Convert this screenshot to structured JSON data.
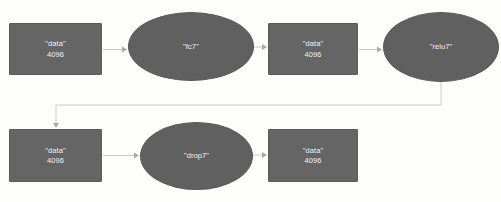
{
  "diagram": {
    "type": "neural-network-graph",
    "background_color": "#fdfdfc",
    "blob_fill": "#656565",
    "layer_fill": "#606060",
    "edge_color": "#c9c9c9",
    "text_color": "#f2f2f2",
    "nodes": [
      {
        "id": "data-1",
        "shape": "rectangle",
        "role": "blob",
        "name": "\"data\"",
        "dim": "4096",
        "x": 9,
        "y": 23,
        "w": 93,
        "h": 52
      },
      {
        "id": "fc7",
        "shape": "ellipse",
        "role": "layer",
        "name": "\"fc7\"",
        "dim": "",
        "x": 128,
        "y": 12,
        "w": 126,
        "h": 69
      },
      {
        "id": "data-2",
        "shape": "rectangle",
        "role": "blob",
        "name": "\"data\"",
        "dim": "4096",
        "x": 268,
        "y": 23,
        "w": 90,
        "h": 52
      },
      {
        "id": "relu7",
        "shape": "ellipse",
        "role": "layer",
        "name": "\"relu7\"",
        "dim": "",
        "x": 383,
        "y": 12,
        "w": 116,
        "h": 70
      },
      {
        "id": "data-3",
        "shape": "rectangle",
        "role": "blob",
        "name": "\"data\"",
        "dim": "4096",
        "x": 9,
        "y": 129,
        "w": 93,
        "h": 53
      },
      {
        "id": "drop7",
        "shape": "ellipse",
        "role": "layer",
        "name": "\"drop7\"",
        "dim": "",
        "x": 140,
        "y": 122,
        "w": 113,
        "h": 68
      },
      {
        "id": "data-4",
        "shape": "rectangle",
        "role": "blob",
        "name": "\"data\"",
        "dim": "4096",
        "x": 268,
        "y": 129,
        "w": 90,
        "h": 53
      }
    ],
    "edges": [
      {
        "id": "e1",
        "from": "data-1",
        "to": "fc7",
        "path": "M 103,49.5 L 126,49.5",
        "arrow_at": [
          126,
          49.5
        ],
        "arrow_dir": "right"
      },
      {
        "id": "e2",
        "from": "fc7",
        "to": "data-2",
        "path": "M 254,47 L 266,47",
        "arrow_at": [
          266,
          47
        ],
        "arrow_dir": "right"
      },
      {
        "id": "e3",
        "from": "data-2",
        "to": "relu7",
        "path": "M 359,49.5 L 381,49.5",
        "arrow_at": [
          381,
          49.5
        ],
        "arrow_dir": "right"
      },
      {
        "id": "e4",
        "from": "relu7",
        "to": "data-3",
        "path": "M 441,82 L 441,105 L 56,105 L 56,127",
        "arrow_at": [
          56,
          127
        ],
        "arrow_dir": "down"
      },
      {
        "id": "e5",
        "from": "data-3",
        "to": "drop7",
        "path": "M 103,155.5 L 138,155.5",
        "arrow_at": [
          138,
          155.5
        ],
        "arrow_dir": "right"
      },
      {
        "id": "e6",
        "from": "drop7",
        "to": "data-4",
        "path": "M 253,155 L 266,155",
        "arrow_at": [
          266,
          155
        ],
        "arrow_dir": "right"
      }
    ]
  }
}
